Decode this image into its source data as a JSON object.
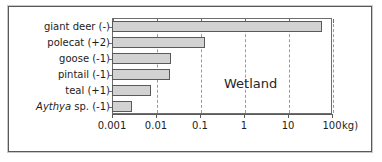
{
  "chart_data": {
    "type": "bar",
    "orientation": "horizontal",
    "title": "",
    "annotation": "Wetland",
    "xlabel": "100 kg)",
    "ylabel": "",
    "xscale": "log",
    "xlim": [
      0.001,
      100
    ],
    "grid": true,
    "legend": null,
    "unit_suffix": "kg)",
    "tick_labels": [
      "0.001",
      "0.01",
      "0.1",
      "1",
      "10",
      "100"
    ],
    "tick_values": [
      0.001,
      0.01,
      0.1,
      1,
      10,
      100
    ],
    "categories": [
      "giant deer (-)",
      "polecat (+2)",
      "goose (-1)",
      "pintail (-1)",
      "teal (+1)",
      "Aythya sp. (-1)"
    ],
    "category_parts": [
      {
        "italic": "",
        "plain": "giant deer (-)"
      },
      {
        "italic": "",
        "plain": "polecat (+2)"
      },
      {
        "italic": "",
        "plain": "goose (-1)"
      },
      {
        "italic": "",
        "plain": "pintail (-1)"
      },
      {
        "italic": "",
        "plain": "teal (+1)"
      },
      {
        "italic": "Aythya",
        "plain": " sp. (-1)"
      }
    ],
    "values": [
      60,
      0.13,
      0.022,
      0.021,
      0.0075,
      0.0029
    ]
  },
  "colors": {
    "bar_fill": "#d2d2d2",
    "bar_edge": "#5a5a5a",
    "axis": "#5a5a5a",
    "grid": "#9a9a9a",
    "text": "#1c1c1c",
    "frame": "#595959",
    "background": "#ffffff"
  }
}
